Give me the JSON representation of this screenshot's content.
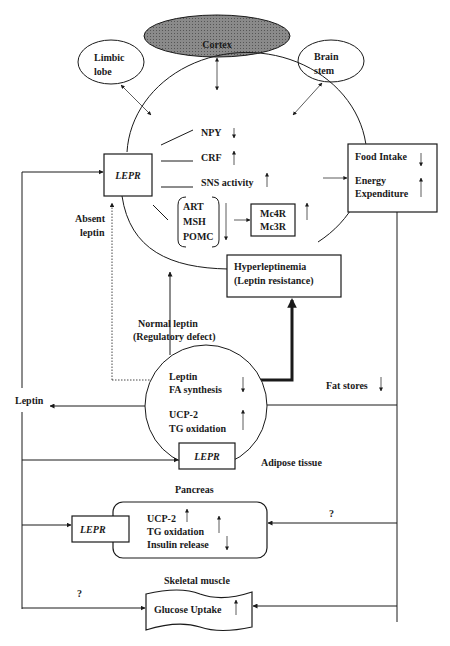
{
  "diagram": {
    "brain": {
      "cortex": "Cortex",
      "limbic": [
        "Limbic",
        "lobe"
      ],
      "brainstem": [
        "Brain",
        "stem"
      ]
    },
    "hypothalamus": {
      "lepr": "LEPR",
      "npy": "NPY",
      "crf": "CRF",
      "sns": "SNS activity",
      "group": [
        "ART",
        "MSH",
        "POMC"
      ],
      "receptor": [
        "Mc4R",
        "Mc3R"
      ],
      "hyper": [
        "Hyperleptinemia",
        "(Leptin resistance)"
      ]
    },
    "food_box": {
      "food": "Food Intake",
      "energy": [
        "Energy",
        "Expenditure"
      ]
    },
    "labels": {
      "absent": [
        "Absent",
        "leptin"
      ],
      "normal": [
        "Normal leptin",
        "(Regulatory defect)"
      ],
      "leptin_out": "Leptin",
      "fat_stores": "Fat stores",
      "adipose": "Adipose tissue",
      "pancreas": "Pancreas",
      "skeletal": "Skeletal muscle",
      "question1": "?",
      "question2": "?"
    },
    "adipose": {
      "leptin": "Leptin",
      "fa": "FA synthesis",
      "ucp": "UCP-2",
      "tg": "TG oxidation",
      "lepr": "LEPR"
    },
    "pancreas_box": {
      "lepr": "LEPR",
      "ucp": "UCP-2",
      "tg": "TG oxidation",
      "insulin": "Insulin release"
    },
    "muscle": {
      "glucose": "Glucose Uptake"
    }
  }
}
